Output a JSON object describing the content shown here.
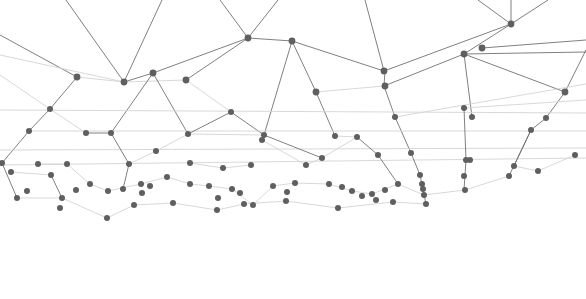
{
  "graphic": {
    "type": "network-mesh",
    "background": "#ffffff",
    "node_color": "#5f5f5f",
    "edge_color_dark": "#6a6a6a",
    "edge_color_light": "#d4d4d4",
    "nodes": [
      [
        248,
        38
      ],
      [
        292,
        41
      ],
      [
        511,
        24
      ],
      [
        77,
        77
      ],
      [
        124,
        82
      ],
      [
        153,
        73
      ],
      [
        186,
        80
      ],
      [
        384,
        71
      ],
      [
        385,
        86
      ],
      [
        464,
        54
      ],
      [
        482,
        48
      ],
      [
        50,
        109
      ],
      [
        231,
        112
      ],
      [
        264,
        135
      ],
      [
        316,
        92
      ],
      [
        395,
        117
      ],
      [
        565,
        92
      ],
      [
        29,
        131
      ],
      [
        86,
        133
      ],
      [
        111,
        133
      ],
      [
        188,
        134
      ],
      [
        335,
        136
      ],
      [
        357,
        137
      ],
      [
        464,
        108
      ],
      [
        472,
        117
      ],
      [
        546,
        118
      ],
      [
        531,
        130
      ],
      [
        2,
        163
      ],
      [
        11,
        172
      ],
      [
        38,
        164
      ],
      [
        51,
        175
      ],
      [
        67,
        164
      ],
      [
        129,
        164
      ],
      [
        156,
        151
      ],
      [
        190,
        163
      ],
      [
        223,
        168
      ],
      [
        251,
        165
      ],
      [
        262,
        140
      ],
      [
        306,
        165
      ],
      [
        322,
        158
      ],
      [
        378,
        155
      ],
      [
        411,
        153
      ],
      [
        466,
        160
      ],
      [
        470,
        160
      ],
      [
        17,
        198
      ],
      [
        27,
        191
      ],
      [
        62,
        198
      ],
      [
        76,
        190
      ],
      [
        90,
        184
      ],
      [
        108,
        191
      ],
      [
        123,
        189
      ],
      [
        141,
        184
      ],
      [
        150,
        186
      ],
      [
        167,
        177
      ],
      [
        142,
        193
      ],
      [
        173,
        203
      ],
      [
        190,
        184
      ],
      [
        209,
        186
      ],
      [
        218,
        198
      ],
      [
        232,
        189
      ],
      [
        240,
        193
      ],
      [
        253,
        205
      ],
      [
        273,
        186
      ],
      [
        295,
        183
      ],
      [
        287,
        192
      ],
      [
        329,
        184
      ],
      [
        342,
        187
      ],
      [
        352,
        191
      ],
      [
        362,
        196
      ],
      [
        372,
        194
      ],
      [
        376,
        200
      ],
      [
        385,
        190
      ],
      [
        398,
        184
      ],
      [
        393,
        202
      ],
      [
        420,
        175
      ],
      [
        422,
        184
      ],
      [
        423,
        189
      ],
      [
        424,
        195
      ],
      [
        426,
        204
      ],
      [
        464,
        176
      ],
      [
        465,
        190
      ],
      [
        509,
        176
      ],
      [
        514,
        166
      ],
      [
        538,
        171
      ],
      [
        575,
        155
      ],
      [
        107,
        218
      ],
      [
        134,
        205
      ],
      [
        217,
        210
      ],
      [
        244,
        204
      ],
      [
        286,
        201
      ],
      [
        60,
        208
      ],
      [
        338,
        208
      ]
    ],
    "edges": [
      [
        124,
        82,
        66,
        0,
        "d"
      ],
      [
        124,
        82,
        162,
        0,
        "d"
      ],
      [
        248,
        38,
        220,
        0,
        "d"
      ],
      [
        248,
        38,
        278,
        0,
        "d"
      ],
      [
        384,
        71,
        365,
        0,
        "d"
      ],
      [
        511,
        24,
        478,
        0,
        "d"
      ],
      [
        511,
        24,
        548,
        0,
        "d"
      ],
      [
        511,
        24,
        511,
        0,
        "d"
      ],
      [
        124,
        82,
        153,
        73,
        "d"
      ],
      [
        124,
        82,
        77,
        77,
        "l"
      ],
      [
        124,
        82,
        186,
        80,
        "l"
      ],
      [
        153,
        73,
        248,
        38,
        "d"
      ],
      [
        186,
        80,
        248,
        38,
        "d"
      ],
      [
        248,
        38,
        292,
        41,
        "d"
      ],
      [
        292,
        41,
        384,
        71,
        "d"
      ],
      [
        292,
        41,
        316,
        92,
        "d"
      ],
      [
        384,
        71,
        511,
        24,
        "d"
      ],
      [
        384,
        86,
        464,
        54,
        "d"
      ],
      [
        464,
        54,
        511,
        24,
        "d"
      ],
      [
        464,
        54,
        586,
        52,
        "d"
      ],
      [
        0,
        35,
        77,
        77,
        "d"
      ],
      [
        0,
        55,
        124,
        82,
        "l"
      ],
      [
        77,
        77,
        50,
        109,
        "d"
      ],
      [
        50,
        109,
        29,
        131,
        "d"
      ],
      [
        29,
        131,
        2,
        163,
        "d"
      ],
      [
        50,
        109,
        0,
        75,
        "l"
      ],
      [
        153,
        73,
        111,
        133,
        "d"
      ],
      [
        153,
        73,
        188,
        134,
        "d"
      ],
      [
        186,
        80,
        231,
        112,
        "l"
      ],
      [
        231,
        112,
        264,
        135,
        "d"
      ],
      [
        264,
        135,
        292,
        41,
        "d"
      ],
      [
        316,
        92,
        384,
        86,
        "l"
      ],
      [
        316,
        92,
        335,
        136,
        "d"
      ],
      [
        384,
        86,
        395,
        117,
        "d"
      ],
      [
        395,
        117,
        411,
        153,
        "d"
      ],
      [
        464,
        54,
        472,
        117,
        "d"
      ],
      [
        464,
        54,
        565,
        92,
        "d"
      ],
      [
        565,
        92,
        586,
        50,
        "d"
      ],
      [
        565,
        92,
        546,
        118,
        "d"
      ],
      [
        546,
        118,
        531,
        130,
        "d"
      ],
      [
        531,
        130,
        509,
        176,
        "d"
      ],
      [
        29,
        131,
        586,
        131,
        "l"
      ],
      [
        0,
        110,
        586,
        113,
        "l"
      ],
      [
        0,
        150,
        586,
        148,
        "l"
      ],
      [
        0,
        165,
        586,
        158,
        "l"
      ],
      [
        86,
        133,
        50,
        109,
        "l"
      ],
      [
        111,
        133,
        86,
        133,
        "d"
      ],
      [
        188,
        134,
        231,
        112,
        "d"
      ],
      [
        188,
        134,
        264,
        135,
        "l"
      ],
      [
        335,
        136,
        357,
        137,
        "l"
      ],
      [
        111,
        133,
        129,
        164,
        "d"
      ],
      [
        129,
        164,
        156,
        151,
        "l"
      ],
      [
        156,
        151,
        188,
        134,
        "l"
      ],
      [
        190,
        163,
        223,
        168,
        "l"
      ],
      [
        223,
        168,
        251,
        165,
        "l"
      ],
      [
        262,
        140,
        306,
        165,
        "l"
      ],
      [
        306,
        165,
        322,
        158,
        "l"
      ],
      [
        322,
        158,
        357,
        137,
        "l"
      ],
      [
        357,
        137,
        378,
        155,
        "d"
      ],
      [
        378,
        155,
        398,
        184,
        "d"
      ],
      [
        411,
        153,
        420,
        175,
        "d"
      ],
      [
        420,
        175,
        426,
        204,
        "d"
      ],
      [
        464,
        108,
        466,
        160,
        "d"
      ],
      [
        466,
        160,
        464,
        190,
        "d"
      ],
      [
        464,
        108,
        586,
        100,
        "l"
      ],
      [
        531,
        130,
        514,
        166,
        "d"
      ],
      [
        514,
        166,
        538,
        171,
        "l"
      ],
      [
        538,
        171,
        575,
        155,
        "l"
      ],
      [
        2,
        163,
        17,
        198,
        "d"
      ],
      [
        38,
        164,
        67,
        164,
        "l"
      ],
      [
        67,
        164,
        90,
        184,
        "l"
      ],
      [
        90,
        184,
        108,
        191,
        "l"
      ],
      [
        108,
        191,
        141,
        184,
        "l"
      ],
      [
        141,
        184,
        167,
        177,
        "l"
      ],
      [
        167,
        177,
        190,
        184,
        "l"
      ],
      [
        190,
        184,
        209,
        186,
        "l"
      ],
      [
        209,
        186,
        232,
        189,
        "l"
      ],
      [
        232,
        189,
        253,
        205,
        "l"
      ],
      [
        253,
        205,
        273,
        186,
        "l"
      ],
      [
        273,
        186,
        295,
        183,
        "l"
      ],
      [
        295,
        183,
        329,
        184,
        "l"
      ],
      [
        329,
        184,
        352,
        191,
        "l"
      ],
      [
        352,
        191,
        372,
        194,
        "l"
      ],
      [
        372,
        194,
        398,
        184,
        "l"
      ],
      [
        398,
        184,
        424,
        195,
        "l"
      ],
      [
        424,
        195,
        465,
        190,
        "l"
      ],
      [
        465,
        190,
        509,
        176,
        "l"
      ],
      [
        17,
        198,
        62,
        198,
        "l"
      ],
      [
        62,
        198,
        107,
        218,
        "l"
      ],
      [
        107,
        218,
        134,
        205,
        "l"
      ],
      [
        134,
        205,
        173,
        203,
        "l"
      ],
      [
        173,
        203,
        217,
        210,
        "l"
      ],
      [
        217,
        210,
        244,
        204,
        "l"
      ],
      [
        244,
        204,
        286,
        201,
        "l"
      ],
      [
        286,
        201,
        338,
        208,
        "l"
      ],
      [
        338,
        208,
        393,
        202,
        "l"
      ],
      [
        393,
        202,
        426,
        204,
        "l"
      ],
      [
        129,
        164,
        123,
        189,
        "d"
      ],
      [
        51,
        175,
        62,
        198,
        "d"
      ],
      [
        11,
        172,
        51,
        175,
        "l"
      ],
      [
        264,
        135,
        322,
        158,
        "d"
      ],
      [
        395,
        117,
        586,
        84,
        "l"
      ],
      [
        482,
        48,
        586,
        40,
        "d"
      ],
      [
        384,
        86,
        385,
        71,
        "d"
      ]
    ]
  }
}
